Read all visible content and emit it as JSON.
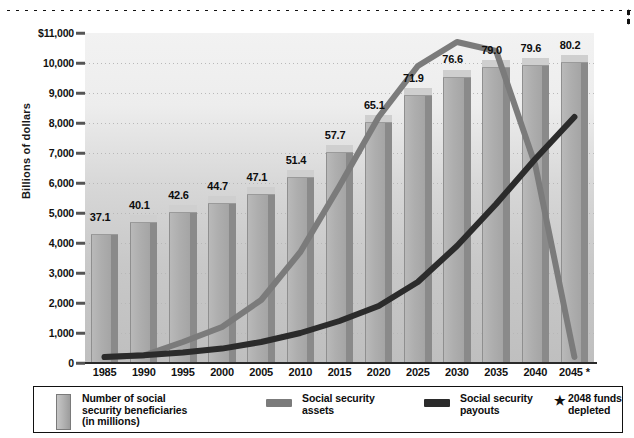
{
  "chart_data": {
    "type": "bar",
    "title": "",
    "xlabel": "",
    "ylabel": "Billions of dollars",
    "ylim": [
      0,
      11000
    ],
    "grid": true,
    "legend_position": "bottom",
    "categories": [
      "1985",
      "1990",
      "1995",
      "2000",
      "2005",
      "2010",
      "2015",
      "2020",
      "2025",
      "2030",
      "2035",
      "2040",
      "2045 *"
    ],
    "ytick_labels": [
      "$11,000",
      "10,000",
      "9,000",
      "8,000",
      "7,000",
      "6,000",
      "5,000",
      "4,000",
      "3,000",
      "2,000",
      "1,000",
      "0"
    ],
    "ytick_values": [
      11000,
      10000,
      9000,
      8000,
      7000,
      6000,
      5000,
      4000,
      3000,
      2000,
      1000,
      0
    ],
    "series": [
      {
        "name": "Number of social security beneficiaries (in millions)",
        "type": "bar",
        "data_labels": [
          "37.1",
          "40.1",
          "42.6",
          "44.7",
          "47.1",
          "51.4",
          "57.7",
          "65.1",
          "71.9",
          "76.6",
          "79.0",
          "79.6",
          "80.2"
        ],
        "values": [
          37.1,
          40.1,
          42.6,
          44.7,
          47.1,
          51.4,
          57.7,
          65.1,
          71.9,
          76.6,
          79.0,
          79.6,
          80.2
        ],
        "axis": "secondary-implied",
        "color": "#aeaeae"
      },
      {
        "name": "Social security assets",
        "type": "line",
        "values": [
          200,
          250,
          700,
          1200,
          2100,
          3700,
          5900,
          8200,
          9900,
          10700,
          10400,
          6600,
          200
        ],
        "color": "#7b7b7b"
      },
      {
        "name": "Social security payouts",
        "type": "line",
        "values": [
          200,
          260,
          350,
          480,
          700,
          1000,
          1400,
          1900,
          2700,
          3900,
          5300,
          6800,
          8200
        ],
        "color": "#2b2b2b"
      }
    ],
    "annotations": [
      {
        "text": "* 2048 funds depleted",
        "marker": "*"
      }
    ]
  },
  "axis": {
    "y_title": "Billions of dollars"
  },
  "legend": {
    "items": [
      {
        "label": "Number of social\nsecurity beneficiaries\n(in millions)",
        "swatch": "bar-swatch"
      },
      {
        "label": "Social security\nassets",
        "swatch": "line-swatch-assets"
      },
      {
        "label": "Social security\npayouts",
        "swatch": "line-swatch-payouts"
      },
      {
        "label": "2048 funds\ndepleted",
        "swatch": "star-marker",
        "marker": "★"
      }
    ]
  },
  "colors": {
    "bar_face": "#aeaeae",
    "bar_top": "#cfcfcf",
    "bar_side": "#8a8a8a",
    "assets_line": "#7b7b7b",
    "payouts_line": "#2b2b2b",
    "plot_bg": "#d6d6d6",
    "text": "#111111"
  }
}
